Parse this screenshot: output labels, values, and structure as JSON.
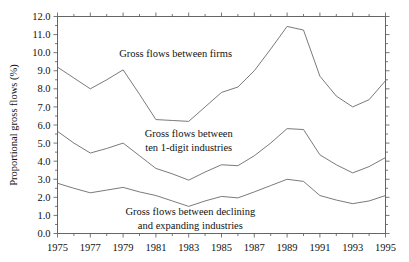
{
  "chart_data": {
    "type": "line",
    "title": "",
    "xlabel": "",
    "ylabel": "Proportional gross flows (%)",
    "xlim": [
      1975,
      1995
    ],
    "ylim": [
      0.0,
      12.0
    ],
    "ytick_step": 1.0,
    "xtick_step": 2,
    "grid": false,
    "legend_position": "inline-annotations",
    "ytick_labels": [
      "0.0",
      "1.0",
      "2.0",
      "3.0",
      "4.0",
      "5.0",
      "6.0",
      "7.0",
      "8.0",
      "9.0",
      "10.0",
      "11.0",
      "12.0"
    ],
    "xtick_labels": [
      "1975",
      "1977",
      "1979",
      "1981",
      "1983",
      "1985",
      "1987",
      "1989",
      "1991",
      "1993",
      "1995"
    ],
    "x": [
      1975,
      1976,
      1977,
      1978,
      1979,
      1980,
      1981,
      1982,
      1983,
      1984,
      1985,
      1986,
      1987,
      1988,
      1989,
      1990,
      1991,
      1992,
      1993,
      1994,
      1995
    ],
    "series": [
      {
        "name": "Gross flows between firms",
        "values": [
          9.2,
          8.6,
          8.0,
          8.5,
          9.05,
          7.7,
          6.3,
          6.25,
          6.2,
          7.0,
          7.8,
          8.1,
          9.0,
          10.2,
          11.45,
          11.25,
          8.7,
          7.6,
          7.0,
          7.4,
          8.45
        ]
      },
      {
        "name": "Gross flows between ten 1-digit industries",
        "values": [
          5.65,
          5.0,
          4.45,
          4.7,
          5.0,
          4.3,
          3.6,
          3.3,
          2.95,
          3.4,
          3.8,
          3.75,
          4.3,
          5.0,
          5.8,
          5.75,
          4.35,
          3.8,
          3.35,
          3.7,
          4.2
        ]
      },
      {
        "name": "Gross flows between declining and expanding industries",
        "values": [
          2.78,
          2.5,
          2.25,
          2.4,
          2.55,
          2.3,
          2.1,
          1.8,
          1.5,
          1.8,
          2.05,
          1.97,
          2.3,
          2.65,
          3.0,
          2.88,
          2.1,
          1.85,
          1.65,
          1.8,
          2.1
        ]
      }
    ],
    "annotations": [
      {
        "id": "annot-firms",
        "lines": [
          "Gross flows between firms"
        ],
        "x": 1982.2,
        "y": 9.75
      },
      {
        "id": "annot-industries",
        "lines": [
          "Gross flows between",
          "ten 1-digit industries"
        ],
        "x": 1983.0,
        "y": 5.35
      },
      {
        "id": "annot-declining",
        "lines": [
          "Gross flows between declining",
          "and expanding industries"
        ],
        "x": 1983.1,
        "y": 1.05
      }
    ]
  },
  "colors": {
    "line": "#6b6b6b",
    "axis": "#555555",
    "text": "#111111",
    "background": "#ffffff"
  }
}
